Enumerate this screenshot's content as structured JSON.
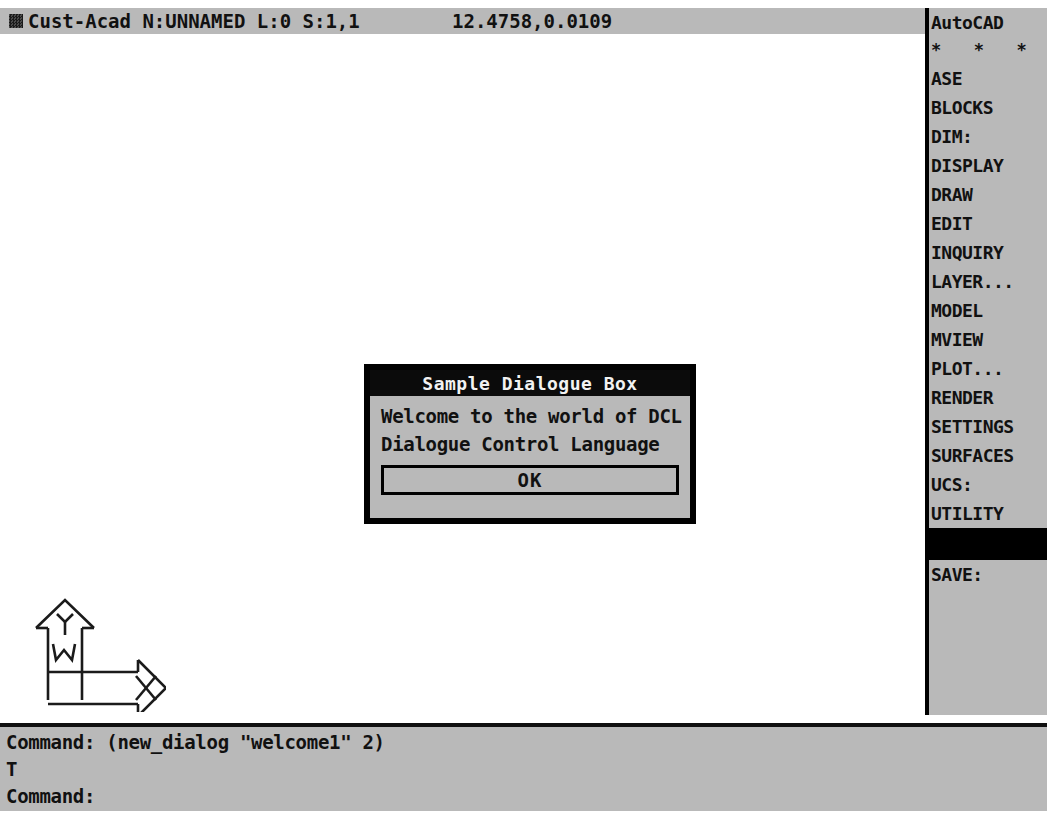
{
  "status_bar": {
    "icon": "dither-square-icon",
    "text": "Cust-Acad N:UNNAMED L:0 S:1,1",
    "coordinates": "12.4758,0.0109"
  },
  "side_menu": {
    "items": [
      {
        "label": "AutoCAD",
        "kind": "title"
      },
      {
        "label": "*  *  *  *",
        "kind": "stars"
      },
      {
        "label": "ASE",
        "kind": "item"
      },
      {
        "label": "BLOCKS",
        "kind": "item"
      },
      {
        "label": "DIM:",
        "kind": "item"
      },
      {
        "label": "DISPLAY",
        "kind": "item"
      },
      {
        "label": "DRAW",
        "kind": "item"
      },
      {
        "label": "EDIT",
        "kind": "item"
      },
      {
        "label": "INQUIRY",
        "kind": "item"
      },
      {
        "label": "LAYER...",
        "kind": "item"
      },
      {
        "label": "MODEL",
        "kind": "item"
      },
      {
        "label": "MVIEW",
        "kind": "item"
      },
      {
        "label": "PLOT...",
        "kind": "item"
      },
      {
        "label": "RENDER",
        "kind": "item"
      },
      {
        "label": "SETTINGS",
        "kind": "item"
      },
      {
        "label": "SURFACES",
        "kind": "item"
      },
      {
        "label": "UCS:",
        "kind": "item"
      },
      {
        "label": "UTILITY",
        "kind": "item"
      },
      {
        "label": "",
        "kind": "blank-highlighted"
      },
      {
        "label": "SAVE:",
        "kind": "item"
      }
    ]
  },
  "dialog": {
    "title": "Sample Dialogue Box",
    "line1": "Welcome to the world of DCL",
    "line2": "Dialogue Control Language",
    "ok_label": "OK"
  },
  "command_area": {
    "lines": [
      "Command: (new_dialog \"welcome1\" 2)",
      "T",
      "Command:"
    ]
  },
  "ucs_icon": {
    "x_label": "X",
    "y_label": "Y",
    "world_label": "W"
  },
  "colors": {
    "chrome_gray": "#b9b9b9",
    "black": "#000000",
    "canvas_white": "#ffffff",
    "title_text": "#f2f2f2"
  }
}
